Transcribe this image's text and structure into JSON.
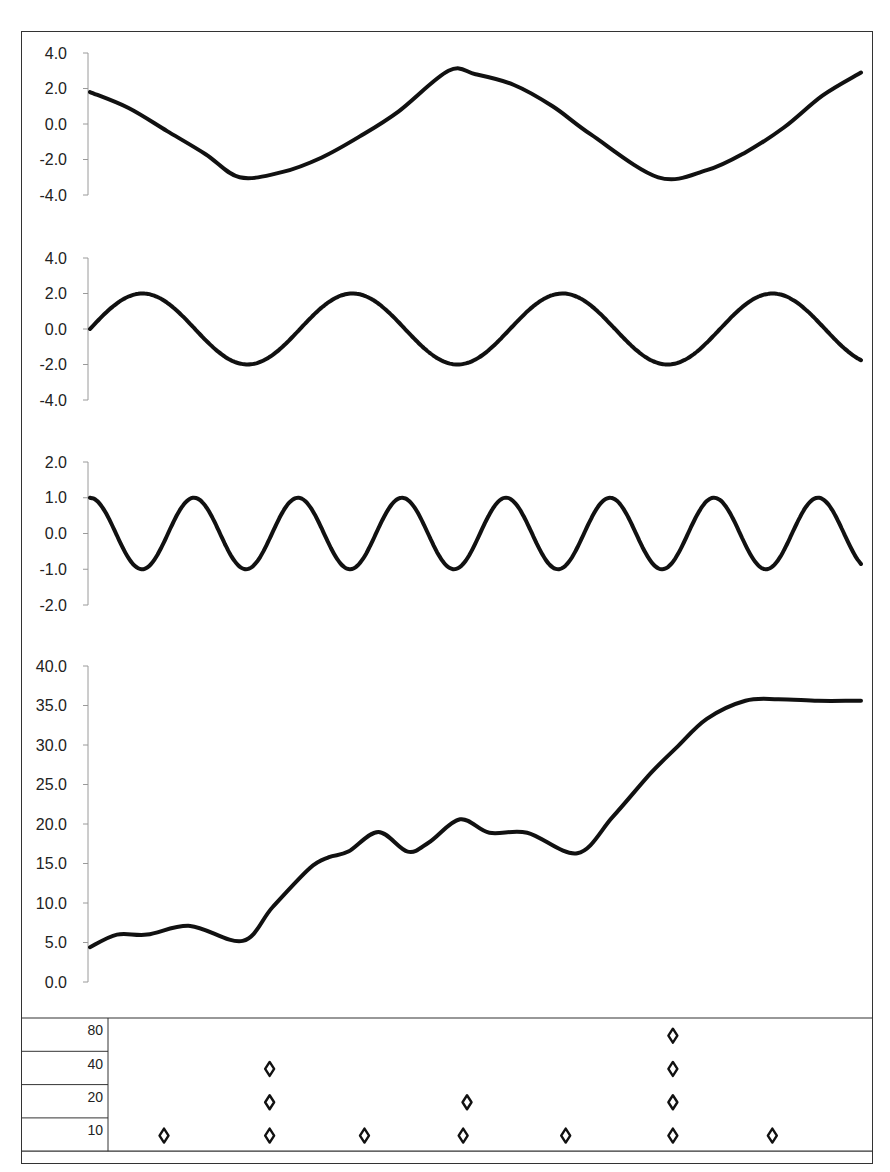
{
  "chart_data": [
    {
      "type": "line",
      "title": "",
      "xlabel": "",
      "ylabel": "",
      "ylim": [
        -4,
        4
      ],
      "yticks": [
        "4.0",
        "2.0",
        "0.0",
        "-2.0",
        "-4.0"
      ],
      "grid": false,
      "description": "Sinusoid, amplitude 3, about 1.85 cycles across the plot",
      "x": [
        0,
        0.05,
        0.1,
        0.15,
        0.194,
        0.25,
        0.3,
        0.35,
        0.4,
        0.465,
        0.5,
        0.55,
        0.6,
        0.65,
        0.737,
        0.8,
        0.85,
        0.9,
        0.95,
        1.0
      ],
      "values": [
        1.8,
        0.9,
        -0.4,
        -1.7,
        -3.0,
        -2.7,
        -1.9,
        -0.7,
        0.7,
        3.0,
        2.8,
        2.2,
        1.0,
        -0.6,
        -3.0,
        -2.6,
        -1.6,
        -0.2,
        1.6,
        2.9
      ]
    },
    {
      "type": "line",
      "title": "",
      "xlabel": "",
      "ylabel": "",
      "ylim": [
        -4,
        4
      ],
      "yticks": [
        "4.0",
        "2.0",
        "0.0",
        "-2.0",
        "-4.0"
      ],
      "grid": false,
      "description": "Sine wave, amplitude 2, period about 210 px (~3.67 cycles)",
      "amplitude": 2,
      "period_fraction": 0.2724,
      "phase": "sine",
      "end_value": -1.6
    },
    {
      "type": "line",
      "title": "",
      "xlabel": "",
      "ylabel": "",
      "ylim": [
        -2,
        2
      ],
      "yticks": [
        "2.0",
        "1.0",
        "0.0",
        "-1.0",
        "-2.0"
      ],
      "grid": false,
      "description": "Cosine wave, amplitude 1, period about 104 px (~7.4 cycles)",
      "amplitude": 1,
      "period_fraction": 0.1349,
      "phase": "cosine",
      "end_value": 0.0
    },
    {
      "type": "line",
      "title": "",
      "xlabel": "",
      "ylabel": "",
      "ylim": [
        0,
        40
      ],
      "yticks": [
        "40.0",
        "35.0",
        "30.0",
        "25.0",
        "20.0",
        "15.0",
        "10.0",
        "5.0",
        "0.0"
      ],
      "grid": false,
      "description": "Sum of the three waves plus a rising trend",
      "x": [
        0,
        0.035,
        0.074,
        0.13,
        0.198,
        0.237,
        0.285,
        0.31,
        0.335,
        0.374,
        0.412,
        0.44,
        0.48,
        0.518,
        0.567,
        0.632,
        0.678,
        0.727,
        0.761,
        0.8,
        0.85,
        0.893,
        0.944,
        0.99,
        1.0
      ],
      "values": [
        4.4,
        6.0,
        6.0,
        7.1,
        5.2,
        9.5,
        14.4,
        15.8,
        16.5,
        19.0,
        16.5,
        17.7,
        20.6,
        18.9,
        18.9,
        16.3,
        20.9,
        26.4,
        29.7,
        33.3,
        35.6,
        35.8,
        35.6,
        35.6,
        35.6
      ]
    },
    {
      "type": "scatter",
      "title": "",
      "description": "Occurrence grid with diamond markers by period row",
      "rows": [
        "80",
        "40",
        "20",
        "10"
      ],
      "marker": "diamond",
      "points": {
        "80": [
          0.756
        ],
        "40": [
          0.233,
          0.756
        ],
        "20": [
          0.233,
          0.489,
          0.756
        ],
        "10": [
          0.096,
          0.233,
          0.356,
          0.484,
          0.617,
          0.756,
          0.885
        ]
      }
    }
  ],
  "table": {
    "row_labels": [
      "80",
      "40",
      "20",
      "10"
    ]
  },
  "colors": {
    "line": "#111111",
    "axis": "#9a9a9a",
    "frame": "#333333"
  }
}
